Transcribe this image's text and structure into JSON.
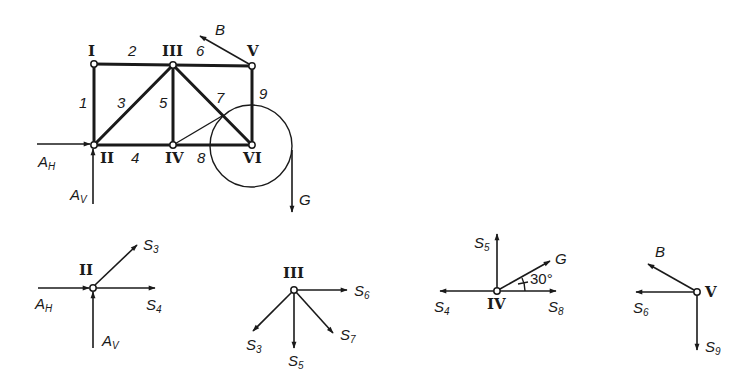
{
  "truss": {
    "nodes": [
      {
        "id": "I",
        "label": "I"
      },
      {
        "id": "II",
        "label": "II"
      },
      {
        "id": "III",
        "label": "III"
      },
      {
        "id": "IV",
        "label": "IV"
      },
      {
        "id": "V",
        "label": "V"
      },
      {
        "id": "VI",
        "label": "VI"
      }
    ],
    "members": [
      {
        "label": "1",
        "from": "I",
        "to": "II"
      },
      {
        "label": "2",
        "from": "I",
        "to": "III"
      },
      {
        "label": "3",
        "from": "II",
        "to": "III"
      },
      {
        "label": "4",
        "from": "II",
        "to": "IV"
      },
      {
        "label": "5",
        "from": "III",
        "to": "IV"
      },
      {
        "label": "6",
        "from": "III",
        "to": "V"
      },
      {
        "label": "7",
        "from": "III",
        "to": "VI"
      },
      {
        "label": "8",
        "from": "IV",
        "to": "VI"
      },
      {
        "label": "9",
        "from": "V",
        "to": "VI"
      }
    ],
    "loads": {
      "ah": {
        "main": "A",
        "sub": "H"
      },
      "av": {
        "main": "A",
        "sub": "V"
      },
      "b": {
        "main": "B"
      },
      "g": {
        "main": "G"
      }
    }
  },
  "fbd": {
    "node_ii": {
      "label": "II",
      "forces": {
        "ah": {
          "main": "A",
          "sub": "H"
        },
        "av": {
          "main": "A",
          "sub": "V"
        },
        "s3": {
          "main": "S",
          "sub": "3"
        },
        "s4": {
          "main": "S",
          "sub": "4"
        }
      }
    },
    "node_iii": {
      "label": "III",
      "forces": {
        "s3": {
          "main": "S",
          "sub": "3"
        },
        "s5": {
          "main": "S",
          "sub": "5"
        },
        "s6": {
          "main": "S",
          "sub": "6"
        },
        "s7": {
          "main": "S",
          "sub": "7"
        }
      }
    },
    "node_iv": {
      "label": "IV",
      "angle": "30°",
      "forces": {
        "s4": {
          "main": "S",
          "sub": "4"
        },
        "s5": {
          "main": "S",
          "sub": "5"
        },
        "s8": {
          "main": "S",
          "sub": "8"
        },
        "g": {
          "main": "G"
        }
      }
    },
    "node_v": {
      "label": "V",
      "forces": {
        "b": {
          "main": "B"
        },
        "s6": {
          "main": "S",
          "sub": "6"
        },
        "s9": {
          "main": "S",
          "sub": "9"
        }
      }
    }
  }
}
